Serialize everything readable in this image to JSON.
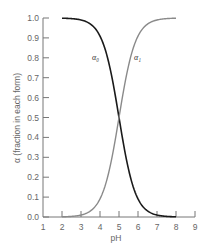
{
  "chart_data": {
    "type": "line",
    "title": "",
    "xlabel": "pH",
    "ylabel": "α (fraction in each form)",
    "xlim": [
      1,
      9
    ],
    "ylim": [
      0.0,
      1.0
    ],
    "xticks": [
      1,
      2,
      3,
      4,
      5,
      6,
      7,
      8,
      9
    ],
    "yticks": [
      0.0,
      0.1,
      0.2,
      0.3,
      0.4,
      0.5,
      0.6,
      0.7,
      0.8,
      0.9,
      1.0
    ],
    "ytick_labels": [
      "0.0",
      "0.1",
      "0.2",
      "0.3",
      "0.4",
      "0.5",
      "0.6",
      "0.7",
      "0.8",
      "0.9",
      "1.0"
    ],
    "grid": false,
    "legend": "inline labels",
    "pKa": 5.0,
    "x": [
      2.0,
      2.5,
      3.0,
      3.5,
      4.0,
      4.5,
      5.0,
      5.5,
      6.0,
      6.5,
      7.0,
      7.5,
      8.0
    ],
    "series": [
      {
        "name": "α0",
        "label_display": "α₀",
        "color": "#1a1a1a",
        "values": [
          0.999,
          0.997,
          0.99,
          0.969,
          0.909,
          0.76,
          0.5,
          0.24,
          0.091,
          0.031,
          0.01,
          0.003,
          0.001
        ]
      },
      {
        "name": "α1",
        "label_display": "α₁",
        "color": "#8a8a8a",
        "values": [
          0.001,
          0.003,
          0.01,
          0.031,
          0.091,
          0.24,
          0.5,
          0.76,
          0.909,
          0.969,
          0.99,
          0.997,
          0.999
        ]
      }
    ]
  }
}
